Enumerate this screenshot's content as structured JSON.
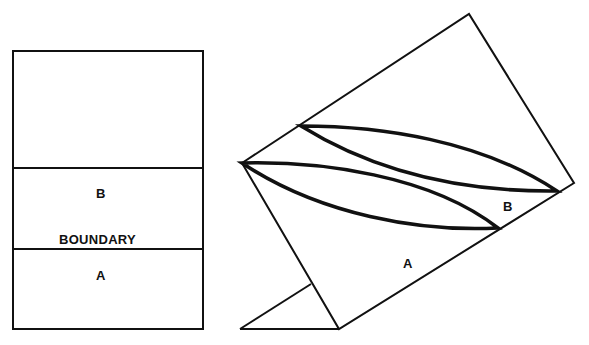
{
  "left_panel": {
    "label_b": "B",
    "label_boundary": "BOUNDARY",
    "label_a": "A"
  },
  "right_panel": {
    "label_b": "B",
    "label_a": "A"
  },
  "colors": {
    "stroke": "#111111",
    "background": "#ffffff"
  }
}
